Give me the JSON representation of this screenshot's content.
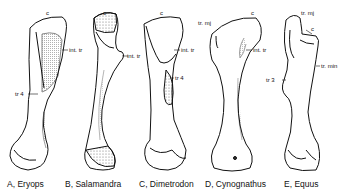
{
  "figure": {
    "specimens": [
      {
        "id": "A",
        "caption": "A, Eryops",
        "labels": {
          "c": "c",
          "int_tr": "int. tr",
          "tr4": "tr 4"
        }
      },
      {
        "id": "B",
        "caption": "B, Salamandra",
        "labels": {
          "c": "c",
          "int_tr": "int. tr"
        }
      },
      {
        "id": "C",
        "caption": "C, Dimetrodon",
        "labels": {
          "c": "c",
          "int_tr": "int. tr",
          "tr4": "tr 4"
        }
      },
      {
        "id": "D",
        "caption": "D, Cynognathus",
        "labels": {
          "c": "c",
          "tr_mj": "tr. mj",
          "int_tr": "int. tr"
        }
      },
      {
        "id": "E",
        "caption": "E, Equus",
        "labels": {
          "c": "c",
          "tr_mj": "tr. mj",
          "tr_min": "tr. min",
          "tr3": "tr 3"
        }
      }
    ],
    "colors": {
      "ink": "#111111",
      "background": "#ffffff",
      "stipple": "#777777"
    }
  }
}
